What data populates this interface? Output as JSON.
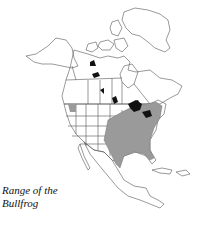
{
  "figure": {
    "caption_line1": "Range of the",
    "caption_line2": "Bullfrog",
    "subject": "Bullfrog",
    "region": "North America"
  },
  "legend": {
    "range_color": "#9a9a9a",
    "introduced_color": "#111111",
    "outline_color": "#555555",
    "background": "#ffffff"
  }
}
